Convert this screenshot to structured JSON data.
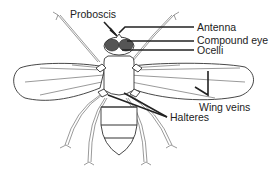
{
  "diagram": {
    "labels": {
      "proboscis": "Proboscis",
      "antenna": "Antenna",
      "compound_eye": "Compound eye",
      "ocelli": "Ocelli",
      "wing_veins": "Wing veins",
      "halteres": "Halteres"
    },
    "colors": {
      "line": "#222222",
      "eye_fill": "#555555",
      "background": "#ffffff"
    }
  }
}
